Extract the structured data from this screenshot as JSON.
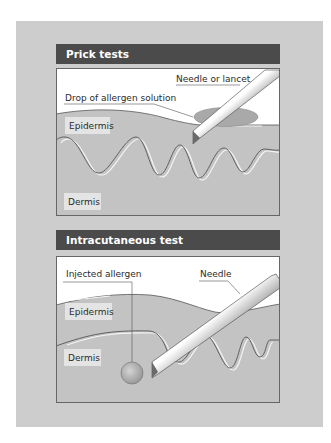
{
  "figure": {
    "background_color": "#cdcdcd",
    "header_color": "#4b4b4b",
    "skin_color": "#c3c3c3",
    "line_color": "#555555"
  },
  "panels": [
    {
      "title": "Prick tests",
      "labels": {
        "needle": "Needle or lancet",
        "drop": "Drop of allergen solution",
        "epidermis": "Epidermis",
        "dermis": "Dermis"
      }
    },
    {
      "title": "Intracutaneous test",
      "labels": {
        "injected": "Injected allergen",
        "needle": "Needle",
        "epidermis": "Epidermis",
        "dermis": "Dermis"
      }
    }
  ]
}
